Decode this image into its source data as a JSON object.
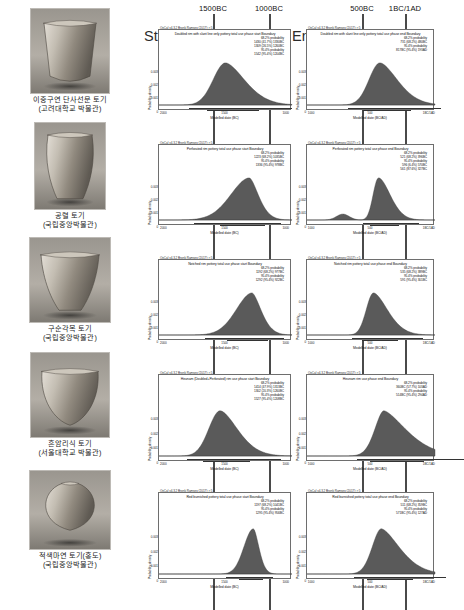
{
  "figure": {
    "column_headers_left": [
      "1500BC",
      "1000BC"
    ],
    "column_headers_right": [
      "500BC",
      "1BC/1AD"
    ],
    "start_label": "Start",
    "end_label": "End",
    "oxcal_stamp": "OxCal v4.3.2 Bronk Ramsey (2017); r:5",
    "x_axis_label_left": "Modelled date (BC)",
    "x_axis_label_right": "Modelled date (BC/AD)"
  },
  "artifacts": [
    {
      "name_line1": "이중구연 단사선문 토기",
      "name_line2": "(고려대학교 박물관)",
      "shape": "deep-bowl"
    },
    {
      "name_line1": "공렬 토기",
      "name_line2": "(국립중앙박물관)",
      "shape": "tall-jar"
    },
    {
      "name_line1": "구순각목 토기",
      "name_line2": "(국립중앙박물관)",
      "shape": "wide-bowl"
    },
    {
      "name_line1": "흔암리식 토기",
      "name_line2": "(서울대학교 박물관)",
      "shape": "round-bowl"
    },
    {
      "name_line1": "적색마연 토기(홍도)",
      "name_line2": "(국립중앙박물관)",
      "shape": "globular-jar"
    }
  ],
  "charts_start": [
    {
      "title": "Doubled rim with slant line only pottery total use phase start Boundary",
      "prob_lines": [
        "68.2% probability",
        "1430 (41.7%) 1330BC",
        "1309 (26.5%) 1260BC",
        "95.4% probability",
        "1542 (95.4%) 1204BC"
      ],
      "y_ticks": [
        "0.003",
        "0.002",
        "0.001",
        "0"
      ],
      "x_ticks": [
        "2000",
        "1500",
        "1000"
      ],
      "y_axis_label": "Probability density",
      "x_axis_label": "Modelled date (BC)"
    },
    {
      "title": "Perforated rim pottery total use phase start Boundary",
      "prob_lines": [
        "68.2% probability",
        "1223 (68.2%) 1035BC",
        "95.4% probability",
        "1336 (95.4%) 978BC"
      ],
      "y_ticks": [
        "0.003",
        "0.002",
        "0.001",
        "0"
      ],
      "x_ticks": [
        "2000",
        "1500",
        "1000"
      ],
      "y_axis_label": "Probability density",
      "x_axis_label": "Modelled date (BC)"
    },
    {
      "title": "Notched rim pottery total use phase start Boundary",
      "prob_lines": [
        "68.2% probability",
        "1192 (68.2%) 977BC",
        "95.4% probability",
        "1292 (95.4%) 922BC"
      ],
      "y_ticks": [
        "0.003",
        "0.002",
        "0.001",
        "0"
      ],
      "x_ticks": [
        "2000",
        "1500",
        "1000"
      ],
      "y_axis_label": "Probability density",
      "x_axis_label": "Modelled date (BC)"
    },
    {
      "title": "Heunam (Doubled+Perforated) rim use phase start Boundary",
      "prob_lines": [
        "68.2% probability",
        "1414 (47.9%) 1313BC",
        "1302 (20.3%) 1260BC",
        "95.4% probability",
        "1527 (95.4%) 1208BC"
      ],
      "y_ticks": [
        "0.003",
        "0.002",
        "0.001",
        "0"
      ],
      "x_ticks": [
        "2000",
        "1500",
        "1000"
      ],
      "y_axis_label": "Probability density",
      "x_axis_label": "Modelled date (BC)"
    },
    {
      "title": "Red burnished pottery total use phase start Boundary",
      "prob_lines": [
        "68.2% probability",
        "1197 (68.2%) 1041BC",
        "95.4% probability",
        "1295 (95.4%) 956BC"
      ],
      "y_ticks": [
        "0.003",
        "0.002",
        "0.001",
        "0"
      ],
      "x_ticks": [
        "2000",
        "1500",
        "1000"
      ],
      "y_axis_label": "Probability density",
      "x_axis_label": "Modelled date (BC)"
    }
  ],
  "charts_end": [
    {
      "title": "Doubled rim with slant line only pottery total use phase end Boundary",
      "prob_lines": [
        "68.2% probability",
        "731 (68.2%) 480BC",
        "95.4% probability",
        "817BC (95.4%) 193AD"
      ],
      "y_ticks": [
        "0.003",
        "0.002",
        "0.001",
        "0"
      ],
      "x_ticks": [
        "1000",
        "500",
        "1BC/1AD"
      ],
      "y_axis_label": "Probability density",
      "x_axis_label": "Modelled date (BC/AD)"
    },
    {
      "title": "Perforated rim pottery total use phase end Boundary",
      "prob_lines": [
        "68.2% probability",
        "521 (68.2%) 396BC",
        "95.4% probability",
        "596 (6.4%) 570BC",
        "561 (87.6%) 327BC"
      ],
      "y_ticks": [
        "0.003",
        "0.002",
        "0.001",
        "0"
      ],
      "x_ticks": [
        "1000",
        "500",
        "1BC/1AD"
      ],
      "y_axis_label": "Probability density",
      "x_axis_label": "Modelled date (BC/AD)"
    },
    {
      "title": "Notched rim pottery total use phase end Boundary",
      "prob_lines": [
        "68.2% probability",
        "535 (68.2%) 389BC",
        "95.4% probability",
        "591 (95.4%) 301BC"
      ],
      "y_ticks": [
        "0.003",
        "0.002",
        "0.001",
        "0"
      ],
      "x_ticks": [
        "1000",
        "500",
        "1BC/1AD"
      ],
      "y_axis_label": "Probability density",
      "x_axis_label": "Modelled date (BC/AD)"
    },
    {
      "title": "Heunam rim use phase end Boundary",
      "prob_lines": [
        "68.2% probability",
        "360BC (57.7%) 103AD",
        "95.4% probability",
        "514BC (95.4%) 294AD"
      ],
      "y_ticks": [
        "0.003",
        "0.002",
        "0.001",
        "0"
      ],
      "x_ticks": [
        "1000",
        "500",
        "1BC/1AD"
      ],
      "y_axis_label": "Probability density",
      "x_axis_label": "Modelled date (BC/AD)"
    },
    {
      "title": "Red burnished pottery total use phase end Boundary",
      "prob_lines": [
        "68.2% probability",
        "511 (68.2%) 359BC",
        "95.4% probability",
        "571BC (95.4%) 127AD"
      ],
      "y_ticks": [
        "0.003",
        "0.002",
        "0.001",
        "0"
      ],
      "x_ticks": [
        "1000",
        "500",
        "1BC/1AD"
      ],
      "y_axis_label": "Probability density",
      "x_axis_label": "Modelled date (BC/AD)"
    }
  ],
  "chart_data": {
    "type": "area",
    "xlabel_left": "Modelled date (BC)",
    "xlabel_right": "Modelled date (BC/AD)",
    "ylabel": "Probability density",
    "grid": false,
    "legend": "none",
    "panels": [
      {
        "row": 1,
        "artifact": "이중구연 단사선문 토기",
        "column": "Start",
        "xlim": [
          2200,
          800
        ],
        "ylim": [
          0,
          0.0035
        ],
        "peak_date_bc": 1360,
        "range_68": [
          1430,
          1260
        ],
        "range_95": [
          1542,
          1204
        ]
      },
      {
        "row": 1,
        "artifact": "이중구연 단사선문 토기",
        "column": "End",
        "xlim": [
          1100,
          400
        ],
        "ylim": [
          0,
          0.0035
        ],
        "peak_date_bc": 620,
        "range_68": [
          731,
          480
        ],
        "range_95": [
          817,
          -193
        ]
      },
      {
        "row": 2,
        "artifact": "공렬 토기",
        "column": "Start",
        "xlim": [
          2200,
          800
        ],
        "ylim": [
          0,
          0.0035
        ],
        "peak_date_bc": 1090,
        "range_68": [
          1223,
          1035
        ],
        "range_95": [
          1336,
          978
        ]
      },
      {
        "row": 2,
        "artifact": "공렬 토기",
        "column": "End",
        "xlim": [
          1100,
          400
        ],
        "ylim": [
          0,
          0.0035
        ],
        "peak_date_bc": 430,
        "range_68": [
          521,
          396
        ],
        "range_95": [
          596,
          327
        ]
      },
      {
        "row": 3,
        "artifact": "구순각목 토기",
        "column": "Start",
        "xlim": [
          2200,
          800
        ],
        "ylim": [
          0,
          0.0035
        ],
        "peak_date_bc": 1010,
        "range_68": [
          1192,
          977
        ],
        "range_95": [
          1292,
          922
        ]
      },
      {
        "row": 3,
        "artifact": "구순각목 토기",
        "column": "End",
        "xlim": [
          1100,
          400
        ],
        "ylim": [
          0,
          0.0035
        ],
        "peak_date_bc": 430,
        "range_68": [
          535,
          389
        ],
        "range_95": [
          591,
          301
        ]
      },
      {
        "row": 4,
        "artifact": "흔암리식 토기",
        "column": "Start",
        "xlim": [
          2200,
          800
        ],
        "ylim": [
          0,
          0.0035
        ],
        "peak_date_bc": 1350,
        "range_68": [
          1414,
          1260
        ],
        "range_95": [
          1527,
          1208
        ]
      },
      {
        "row": 4,
        "artifact": "흔암리식 토기",
        "column": "End",
        "xlim": [
          1100,
          400
        ],
        "ylim": [
          0,
          0.0035
        ],
        "peak_date_bc": 100,
        "range_68": [
          360,
          -103
        ],
        "range_95": [
          514,
          -294
        ]
      },
      {
        "row": 5,
        "artifact": "적색마연 토기(홍도)",
        "column": "Start",
        "xlim": [
          2200,
          800
        ],
        "ylim": [
          0,
          0.0035
        ],
        "peak_date_bc": 1070,
        "range_68": [
          1197,
          1041
        ],
        "range_95": [
          1295,
          956
        ]
      },
      {
        "row": 5,
        "artifact": "적색마연 토기(홍도)",
        "column": "End",
        "xlim": [
          1100,
          400
        ],
        "ylim": [
          0,
          0.0035
        ],
        "peak_date_bc": 450,
        "range_68": [
          511,
          359
        ],
        "range_95": [
          571,
          -127
        ]
      }
    ],
    "reference_lines": [
      {
        "label": "1500BC",
        "column": "Start"
      },
      {
        "label": "1000BC",
        "column": "Start"
      },
      {
        "label": "500BC",
        "column": "End"
      },
      {
        "label": "1BC/1AD",
        "column": "End"
      }
    ]
  }
}
